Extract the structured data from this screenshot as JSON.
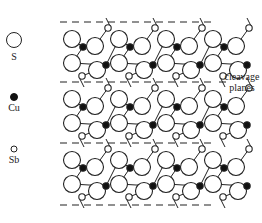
{
  "legend": {
    "items": [
      {
        "symbol": "S",
        "label": "S",
        "style": "large-open-circle",
        "cx": 14,
        "cy": 40,
        "r": 7.5,
        "label_y": 60
      },
      {
        "symbol": "Cu",
        "label": "Cu",
        "style": "small-filled-circle",
        "cx": 14,
        "cy": 97,
        "r": 3.5,
        "label_y": 111
      },
      {
        "symbol": "Sb",
        "label": "Sb",
        "style": "small-open-circle",
        "cx": 14,
        "cy": 149,
        "r": 3,
        "label_y": 163
      }
    ]
  },
  "annotation": {
    "line1": "cleavage",
    "line2": "planes",
    "x": 242,
    "y1": 80,
    "y2": 91
  },
  "planes": {
    "x_start": 60,
    "x_end": 216,
    "y": [
      22,
      82,
      143,
      205
    ],
    "dash": "7,5",
    "label_line_x1": 219,
    "label_line_x2": 226
  },
  "lattice": {
    "x0": 72,
    "period_x": 47,
    "columns": 4,
    "layer_height": 61,
    "layers": 3,
    "unit_atoms": [
      {
        "type": "S",
        "dx": 0,
        "dy": 17,
        "r": 8.5
      },
      {
        "type": "S",
        "dx": 0,
        "dy": 41,
        "r": 8.5
      },
      {
        "type": "Cu",
        "dx": 11,
        "dy": 25,
        "r": 3.2
      },
      {
        "type": "Sb",
        "dx": 10,
        "dy": 54,
        "r": 3.2
      },
      {
        "type": "S",
        "dx": 23,
        "dy": 24,
        "r": 8.5
      },
      {
        "type": "S",
        "dx": 25,
        "dy": 48,
        "r": 8.5
      },
      {
        "type": "Cu",
        "dx": 34,
        "dy": 43,
        "r": 3.2
      },
      {
        "type": "Sb",
        "dx": 36,
        "dy": 6,
        "r": 3.2
      }
    ],
    "unit_bonds": [
      [
        2,
        4
      ],
      [
        2,
        0
      ],
      [
        2,
        1
      ],
      [
        6,
        5
      ],
      [
        6,
        1
      ],
      [
        6,
        8
      ],
      [
        3,
        5
      ],
      [
        7,
        4
      ]
    ],
    "bond_extra": {
      "next_col_atom": 0
    }
  },
  "colors": {
    "line": "#222222",
    "cu_fill": "#111111",
    "open_fill": "#ffffff"
  }
}
